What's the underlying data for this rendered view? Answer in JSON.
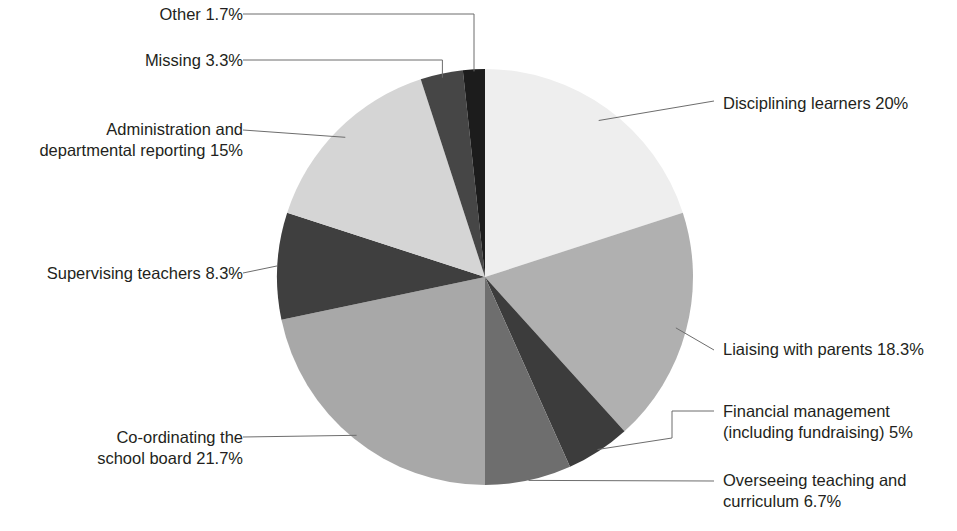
{
  "chart_data": {
    "type": "pie",
    "title": "",
    "subtitle": "",
    "xlabel": "",
    "ylabel": "",
    "legend_position": "callout-labels",
    "grid": false,
    "start_angle_deg": 0,
    "direction": "clockwise",
    "total_percent": 100,
    "categories": [
      "Disciplining learners",
      "Liaising with parents",
      "Financial management (including fundraising)",
      "Overseeing teaching and curriculum",
      "Co-ordinating the school board",
      "Supervising teachers",
      "Administration and departmental reporting",
      "Missing",
      "Other"
    ],
    "values": [
      20,
      18.3,
      5,
      6.7,
      21.7,
      8.3,
      15,
      3.3,
      1.7
    ],
    "value_labels": [
      "20%",
      "18.3%",
      "5%",
      "6.7%",
      "21.7%",
      "8.3%",
      "15%",
      "3.3%",
      "1.7%"
    ],
    "colors": [
      "#eeeeee",
      "#b0b0b0",
      "#3c3c3c",
      "#6e6e6e",
      "#a8a8a8",
      "#3f3f3f",
      "#d5d5d5",
      "#464646",
      "#1c1c1c"
    ],
    "slices": [
      {
        "id": "disciplining-learners",
        "label": "Disciplining learners 20%",
        "name": "Disciplining learners",
        "value": 20,
        "value_text": "20%",
        "color": "#eeeeee"
      },
      {
        "id": "liaising-with-parents",
        "label": "Liaising with parents 18.3%",
        "name": "Liaising with parents",
        "value": 18.3,
        "value_text": "18.3%",
        "color": "#b0b0b0"
      },
      {
        "id": "financial-management",
        "label": "Financial management\n(including fundraising) 5%",
        "name": "Financial management (including fundraising)",
        "value": 5,
        "value_text": "5%",
        "color": "#3c3c3c"
      },
      {
        "id": "overseeing-teaching",
        "label": "Overseeing teaching and\ncurriculum 6.7%",
        "name": "Overseeing teaching and curriculum",
        "value": 6.7,
        "value_text": "6.7%",
        "color": "#6e6e6e"
      },
      {
        "id": "co-ordinating-school-board",
        "label": "Co-ordinating the\nschool board 21.7%",
        "name": "Co-ordinating the school board",
        "value": 21.7,
        "value_text": "21.7%",
        "color": "#a8a8a8"
      },
      {
        "id": "supervising-teachers",
        "label": "Supervising teachers 8.3%",
        "name": "Supervising teachers",
        "value": 8.3,
        "value_text": "8.3%",
        "color": "#3f3f3f"
      },
      {
        "id": "administration-departmental-reporting",
        "label": "Administration and\ndepartmental reporting 15%",
        "name": "Administration and departmental reporting",
        "value": 15,
        "value_text": "15%",
        "color": "#d5d5d5"
      },
      {
        "id": "missing",
        "label": "Missing 3.3%",
        "name": "Missing",
        "value": 3.3,
        "value_text": "3.3%",
        "color": "#464646"
      },
      {
        "id": "other",
        "label": "Other 1.7%",
        "name": "Other",
        "value": 1.7,
        "value_text": "1.7%",
        "color": "#1c1c1c"
      }
    ]
  },
  "geometry": {
    "center_x": 485,
    "center_y": 277,
    "radius": 208
  },
  "style": {
    "background": "#ffffff",
    "text_color": "#231f20",
    "leader_color": "#6d6d6d"
  }
}
